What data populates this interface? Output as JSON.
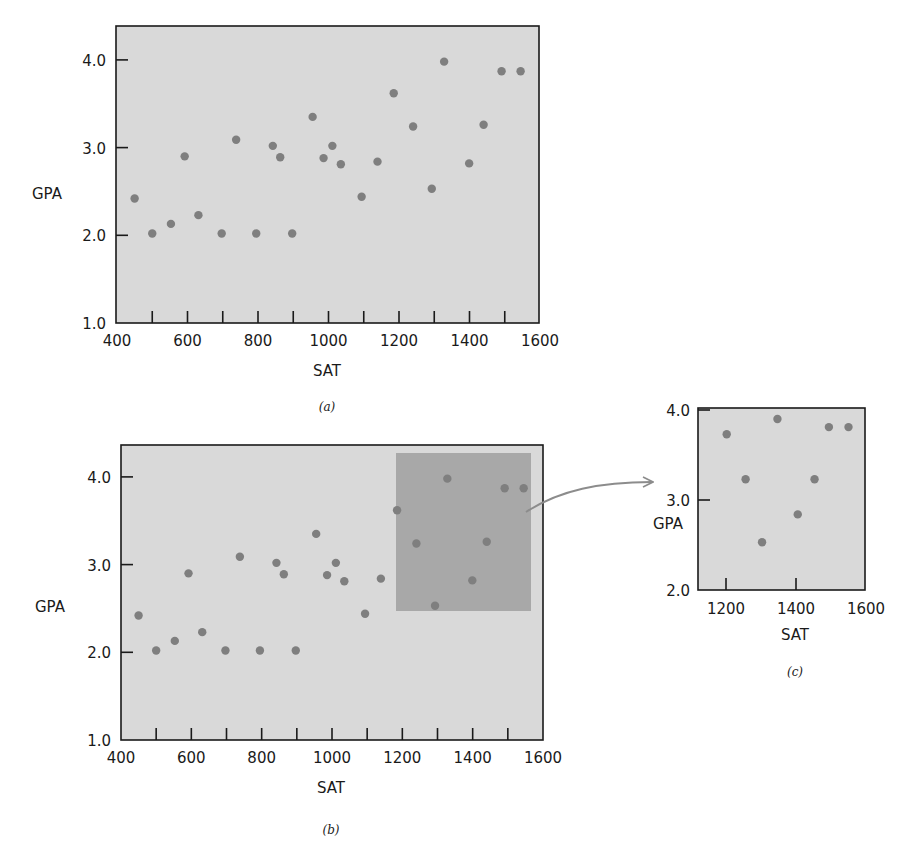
{
  "colors": {
    "plot_background": "#d9d9d9",
    "highlight_region": "#a8a8a8",
    "point": "#7f7f7f",
    "axis": "#1a1a1a",
    "arrow": "#8c8c8c"
  },
  "chart_data": [
    {
      "id": "a",
      "type": "scatter",
      "caption": "(a)",
      "title": "",
      "xlabel": "SAT",
      "ylabel": "GPA",
      "xlim": [
        400,
        1600
      ],
      "ylim": [
        1.0,
        4.35
      ],
      "xticks": [
        400,
        500,
        600,
        700,
        800,
        900,
        1000,
        1100,
        1200,
        1300,
        1400,
        1500,
        1600
      ],
      "xtick_labels": [
        "400",
        "600",
        "800",
        "1000",
        "1200",
        "1400",
        "1600"
      ],
      "yticks": [
        1.0,
        2.0,
        3.0,
        4.0
      ],
      "ytick_labels": [
        "1.0",
        "2.0",
        "3.0",
        "4.0"
      ],
      "grid": false,
      "legend": null,
      "series": [
        {
          "name": "students",
          "x": [
            450,
            500,
            553,
            592,
            631,
            697,
            738,
            795,
            842,
            863,
            897,
            955,
            986,
            1011,
            1035,
            1094,
            1139,
            1185,
            1240,
            1293,
            1328,
            1399,
            1440,
            1491,
            1545
          ],
          "y": [
            2.42,
            2.02,
            2.13,
            2.9,
            2.23,
            2.02,
            3.09,
            2.02,
            3.02,
            2.89,
            2.02,
            3.35,
            2.88,
            3.02,
            2.81,
            2.44,
            2.84,
            3.62,
            3.24,
            2.53,
            3.98,
            2.82,
            3.26,
            3.87,
            3.87
          ]
        }
      ]
    },
    {
      "id": "b",
      "type": "scatter",
      "caption": "(b)",
      "title": "",
      "xlabel": "SAT",
      "ylabel": "GPA",
      "xlim": [
        400,
        1600
      ],
      "ylim": [
        1.0,
        4.35
      ],
      "xticks": [
        400,
        500,
        600,
        700,
        800,
        900,
        1000,
        1100,
        1200,
        1300,
        1400,
        1500,
        1600
      ],
      "xtick_labels": [
        "400",
        "600",
        "800",
        "1000",
        "1200",
        "1400",
        "1600"
      ],
      "yticks": [
        1.0,
        2.0,
        3.0,
        4.0
      ],
      "ytick_labels": [
        "1.0",
        "2.0",
        "3.0",
        "4.0"
      ],
      "grid": false,
      "legend": null,
      "highlight_region": {
        "x": [
          1180,
          1565
        ],
        "y": [
          2.47,
          4.27
        ],
        "note": "shaded subset, magnified in (c)"
      },
      "series": [
        {
          "name": "students",
          "x": [
            450,
            500,
            553,
            592,
            631,
            697,
            738,
            795,
            842,
            863,
            897,
            955,
            986,
            1011,
            1035,
            1094,
            1139,
            1185,
            1240,
            1293,
            1328,
            1399,
            1440,
            1491,
            1545
          ],
          "y": [
            2.42,
            2.02,
            2.13,
            2.9,
            2.23,
            2.02,
            3.09,
            2.02,
            3.02,
            2.89,
            2.02,
            3.35,
            2.88,
            3.02,
            2.81,
            2.44,
            2.84,
            3.62,
            3.24,
            2.53,
            3.98,
            2.82,
            3.26,
            3.87,
            3.87
          ]
        }
      ]
    },
    {
      "id": "c",
      "type": "scatter",
      "caption": "(c)",
      "title": "",
      "xlabel": "SAT",
      "ylabel": "GPA",
      "xlim": [
        1120,
        1600
      ],
      "ylim": [
        2.0,
        4.0
      ],
      "xticks": [
        1200,
        1400
      ],
      "xtick_labels": [
        "1200",
        "1400",
        "1600"
      ],
      "yticks": [
        2.0,
        3.0,
        4.0
      ],
      "ytick_labels": [
        "2.0",
        "3.0",
        "4.0"
      ],
      "grid": false,
      "legend": null,
      "series": [
        {
          "name": "students (zoomed subset)",
          "x": [
            1202,
            1256,
            1303,
            1347,
            1405,
            1453,
            1494,
            1550
          ],
          "y": [
            3.73,
            3.23,
            2.53,
            3.9,
            2.84,
            3.23,
            3.81,
            3.81
          ]
        }
      ]
    }
  ],
  "labels": {
    "a": {
      "xlabel": "SAT",
      "ylabel": "GPA",
      "caption": "(a)"
    },
    "b": {
      "xlabel": "SAT",
      "ylabel": "GPA",
      "caption": "(b)"
    },
    "c": {
      "xlabel": "SAT",
      "ylabel": "GPA",
      "caption": "(c)"
    }
  }
}
